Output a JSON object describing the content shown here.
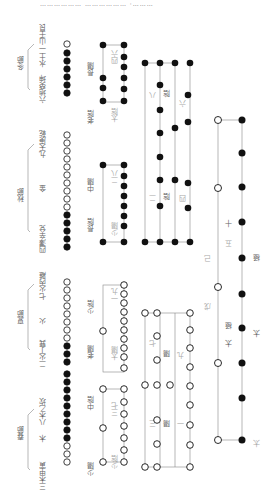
{
  "top_strip_text": "……………… ……………… ·………",
  "seasons": [
    {
      "name": "冬節",
      "labels": [
        "六地癸坤",
        "水土",
        "一山壬艮"
      ],
      "dots": [
        1,
        1,
        1,
        1,
        1,
        1,
        0
      ]
    },
    {
      "name": "秋節",
      "labels": [
        "四澤辛兌",
        "金",
        "九天庚乾"
      ],
      "dots": [
        1,
        1,
        1,
        1,
        1,
        0,
        0,
        0,
        0,
        0,
        0,
        0,
        0,
        0,
        0
      ]
    },
    {
      "name": "夏節",
      "labels": [
        "二火丁巽",
        "火",
        "七火丙離"
      ],
      "dots": [
        1,
        1,
        1,
        0,
        0,
        0,
        0,
        0,
        0,
        0,
        0
      ]
    },
    {
      "name": "春節",
      "labels": [
        "三木甲寅",
        "木",
        "八木乙坎"
      ],
      "dots": [
        0,
        0,
        0,
        1,
        1,
        1,
        1,
        1,
        1,
        1,
        1,
        1
      ]
    }
  ],
  "diagrams": {
    "winter_box": {
      "labels": [
        "老陰",
        "長陽",
        "四六",
        "太陰"
      ]
    },
    "autumn_box": {
      "labels": [
        "長陰",
        "中陽",
        "二八",
        "少陽"
      ]
    },
    "summer_box": {
      "labels": [
        "老陽",
        "少陰",
        "一九",
        "太陽"
      ]
    },
    "spring_box": {
      "labels": [
        "少陽",
        "中陰",
        "三七",
        "少陰"
      ]
    },
    "yin_grid": {
      "labels": [
        "八",
        "陰",
        "六",
        "二",
        "陰",
        "四"
      ]
    },
    "yang_grid": {
      "labels": [
        "七",
        "陽",
        "九",
        "三",
        "陽",
        "一"
      ]
    },
    "great": {
      "labels": [
        "己",
        "戊",
        "五",
        "十",
        "太",
        "極",
        "太",
        "極",
        "太"
      ]
    }
  }
}
